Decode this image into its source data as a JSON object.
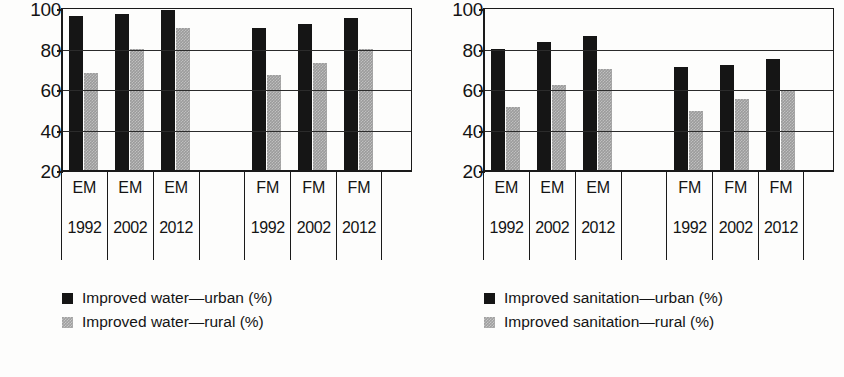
{
  "chart_data": [
    {
      "type": "bar",
      "title": "",
      "panel": "left",
      "xlabel": "",
      "ylabel": "",
      "ylim": [
        20,
        100
      ],
      "yticks": [
        100,
        80,
        60,
        40,
        20
      ],
      "grid": true,
      "legend_position": "below-left",
      "group_labels": [
        "EM",
        "EM",
        "EM",
        "",
        "FM",
        "FM",
        "FM"
      ],
      "categories": [
        "1992",
        "2002",
        "2012",
        "",
        "1992",
        "2002",
        "2012"
      ],
      "series": [
        {
          "name": "Improved water—urban (%)",
          "color": "#151515",
          "values": [
            96,
            97,
            99,
            null,
            90,
            92,
            95
          ]
        },
        {
          "name": "Improved water—rural (%)",
          "color": "#9b9b9b",
          "values": [
            68,
            80,
            90,
            null,
            67,
            73,
            80
          ]
        }
      ]
    },
    {
      "type": "bar",
      "title": "",
      "panel": "right",
      "xlabel": "",
      "ylabel": "",
      "ylim": [
        20,
        100
      ],
      "yticks": [
        100,
        80,
        60,
        40,
        20
      ],
      "grid": true,
      "legend_position": "below-left",
      "group_labels": [
        "EM",
        "EM",
        "EM",
        "",
        "FM",
        "FM",
        "FM"
      ],
      "categories": [
        "1992",
        "2002",
        "2012",
        "",
        "1992",
        "2002",
        "2012"
      ],
      "series": [
        {
          "name": "Improved sanitation—urban (%)",
          "color": "#151515",
          "values": [
            80,
            83,
            86,
            null,
            71,
            72,
            75
          ]
        },
        {
          "name": "Improved sanitation—rural (%)",
          "color": "#9b9b9b",
          "values": [
            51,
            62,
            70,
            null,
            49,
            55,
            59
          ]
        }
      ]
    }
  ]
}
